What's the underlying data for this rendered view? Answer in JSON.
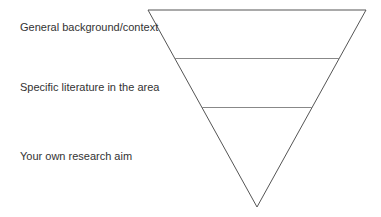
{
  "diagram": {
    "type": "inverted-funnel",
    "levels": [
      {
        "label": "General background/context"
      },
      {
        "label": "Specific literature in the area"
      },
      {
        "label": "Your own research aim"
      }
    ],
    "colors": {
      "outline": "#555555",
      "divider": "#888888",
      "text": "#333333",
      "background": "#ffffff"
    }
  }
}
